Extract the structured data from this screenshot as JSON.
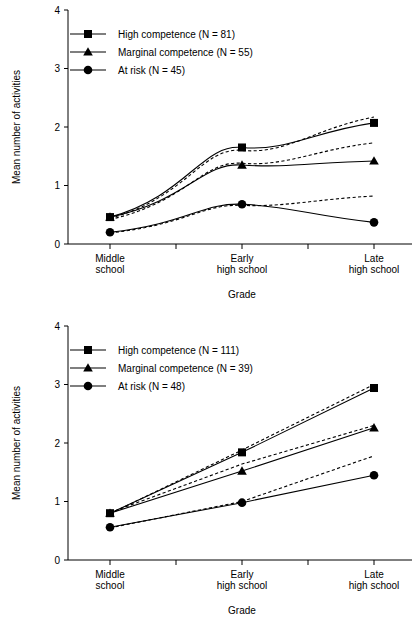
{
  "figure": {
    "panels": [
      "panel_top",
      "panel_bottom"
    ]
  },
  "panel_top": {
    "ylabel": "Mean number of activities",
    "xlabel": "Grade",
    "yticks": [
      "0",
      "1",
      "2",
      "3",
      "4"
    ],
    "categories": [
      "Middle\nschool",
      "Early\nhigh school",
      "Late\nhigh school"
    ],
    "cat_line1": [
      "Middle",
      "Early",
      "Late"
    ],
    "cat_line2": [
      "school",
      "high school",
      "high school"
    ],
    "legend": [
      {
        "label": "High competence (N = 81)",
        "marker": "square-marker"
      },
      {
        "label": "Marginal competence (N = 55)",
        "marker": "triangle-marker"
      },
      {
        "label": "At risk (N = 45)",
        "marker": "circle-marker"
      }
    ]
  },
  "panel_bottom": {
    "ylabel": "Mean number of activities",
    "xlabel": "Grade",
    "yticks": [
      "0",
      "1",
      "2",
      "3",
      "4"
    ],
    "categories": [
      "Middle\nschool",
      "Early\nhigh school",
      "Late\nhigh school"
    ],
    "cat_line1": [
      "Middle",
      "Early",
      "Late"
    ],
    "cat_line2": [
      "school",
      "high school",
      "high school"
    ],
    "legend": [
      {
        "label": "High competence (N = 111)",
        "marker": "square-marker"
      },
      {
        "label": "Marginal competence (N = 39)",
        "marker": "triangle-marker"
      },
      {
        "label": "At risk (N = 48)",
        "marker": "circle-marker"
      }
    ]
  },
  "chart_data": [
    {
      "id": "panel_top",
      "type": "line",
      "title": "",
      "xlabel": "Grade",
      "ylabel": "Mean number of activities",
      "ylim": [
        0,
        4
      ],
      "yticks": [
        0,
        1,
        2,
        3,
        4
      ],
      "grid": false,
      "legend_position": "upper-left",
      "categories": [
        "Middle school",
        "Early high school",
        "Late high school"
      ],
      "x": [
        0,
        1,
        2
      ],
      "series": [
        {
          "name": "High competence (N = 81)",
          "style": "solid",
          "marker": "square",
          "values": [
            0.46,
            1.65,
            2.07
          ]
        },
        {
          "name": "High competence (N = 81) predicted",
          "style": "dashed",
          "marker": "none",
          "values": [
            0.44,
            1.6,
            2.17
          ]
        },
        {
          "name": "Marginal competence (N = 55)",
          "style": "solid",
          "marker": "triangle",
          "values": [
            0.46,
            1.35,
            1.42
          ]
        },
        {
          "name": "Marginal competence (N = 55) predicted",
          "style": "dashed",
          "marker": "none",
          "values": [
            0.42,
            1.38,
            1.73
          ]
        },
        {
          "name": "At risk (N = 45)",
          "style": "solid",
          "marker": "circle",
          "values": [
            0.2,
            0.68,
            0.37
          ]
        },
        {
          "name": "At risk (N = 45) predicted",
          "style": "dashed",
          "marker": "none",
          "values": [
            0.19,
            0.66,
            0.82
          ]
        }
      ]
    },
    {
      "id": "panel_bottom",
      "type": "line",
      "title": "",
      "xlabel": "Grade",
      "ylabel": "Mean number of activities",
      "ylim": [
        0,
        4
      ],
      "yticks": [
        0,
        1,
        2,
        3,
        4
      ],
      "grid": false,
      "legend_position": "upper-left",
      "categories": [
        "Middle school",
        "Early high school",
        "Late high school"
      ],
      "x": [
        0,
        1,
        2
      ],
      "series": [
        {
          "name": "High competence (N = 111)",
          "style": "solid",
          "marker": "square",
          "values": [
            0.8,
            1.84,
            2.94
          ]
        },
        {
          "name": "High competence (N = 111) predicted",
          "style": "dashed",
          "marker": "none",
          "values": [
            0.79,
            1.88,
            3.0
          ]
        },
        {
          "name": "Marginal competence (N = 39)",
          "style": "solid",
          "marker": "triangle",
          "values": [
            0.8,
            1.52,
            2.26
          ]
        },
        {
          "name": "Marginal competence (N = 39) predicted",
          "style": "dashed",
          "marker": "none",
          "values": [
            0.81,
            1.64,
            2.3
          ]
        },
        {
          "name": "At risk (N = 48)",
          "style": "solid",
          "marker": "circle",
          "values": [
            0.56,
            0.98,
            1.45
          ]
        },
        {
          "name": "At risk (N = 48) predicted",
          "style": "dashed",
          "marker": "none",
          "values": [
            0.55,
            1.0,
            1.78
          ]
        }
      ]
    }
  ]
}
